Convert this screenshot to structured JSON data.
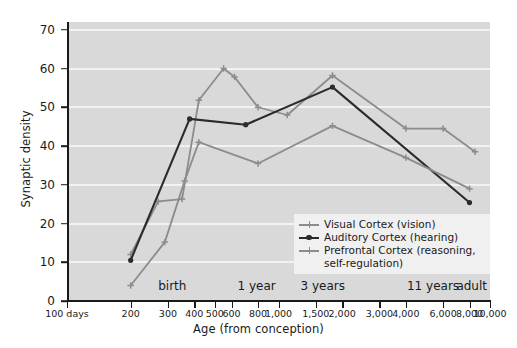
{
  "chart_data": {
    "type": "line",
    "title": "",
    "xlabel": "Age (from conception)",
    "ylabel": "Synaptic density",
    "xscale": "log",
    "x_tick_labels": [
      "100 days",
      "200",
      "300",
      "400",
      "500",
      "600",
      "800",
      "1,000",
      "1,500",
      "2,000",
      "3,000",
      "4,000",
      "6,000",
      "8,000",
      "10,000"
    ],
    "x_tick_values": [
      100,
      200,
      300,
      400,
      500,
      600,
      800,
      1000,
      1500,
      2000,
      3000,
      4000,
      6000,
      8000,
      10000
    ],
    "xlim": [
      100,
      10000
    ],
    "y_tick_labels": [
      "0",
      "10",
      "20",
      "30",
      "40",
      "50",
      "60",
      "70"
    ],
    "y_tick_values": [
      0,
      10,
      20,
      30,
      40,
      50,
      60,
      70
    ],
    "ylim": [
      0,
      72
    ],
    "grid": true,
    "legend_position": "lower right",
    "era_annotations": [
      {
        "label": "birth",
        "x": 270
      },
      {
        "label": "1 year",
        "x": 640
      },
      {
        "label": "3 years",
        "x": 1270
      },
      {
        "label": "11 years",
        "x": 4050
      },
      {
        "label": "adult",
        "x": 9800
      }
    ],
    "series": [
      {
        "name": "Visual Cortex (vision)",
        "color": "#8c8c8c",
        "marker": "plus",
        "x": [
          200,
          270,
          350,
          420,
          550,
          620,
          800,
          1100,
          1800,
          4000,
          6000,
          8500
        ],
        "values": [
          12.0,
          25.7,
          26.3,
          51.8,
          60.0,
          57.8,
          50.0,
          48.0,
          58.2,
          44.5,
          44.5,
          38.5
        ]
      },
      {
        "name": "Auditory Cortex (hearing)",
        "color": "#2b2b2b",
        "marker": "dot",
        "x": [
          200,
          380,
          700,
          1800,
          8000
        ],
        "values": [
          10.5,
          47.0,
          45.5,
          55.2,
          25.4
        ]
      },
      {
        "name": "Prefrontal Cortex (reasoning, self-regulation)",
        "color": "#8c8c8c",
        "marker": "plus",
        "x": [
          200,
          290,
          360,
          420,
          800,
          1800,
          4000,
          8000
        ],
        "values": [
          4.0,
          15.2,
          31.0,
          41.0,
          35.5,
          45.2,
          37.0,
          29.0
        ]
      }
    ]
  },
  "legend": {
    "entries": [
      {
        "label": "Visual Cortex (vision)"
      },
      {
        "label": "Auditory Cortex (hearing)"
      },
      {
        "label": "Prefrontal Cortex (reasoning,"
      }
    ],
    "continuation": "self-regulation)"
  },
  "colors": {
    "plot_background": "#d9d9d9",
    "gridline": "#f2f2f2",
    "axis": "#1a1a1a",
    "light_series": "#8c8c8c",
    "dark_series": "#2b2b2b",
    "legend_background": "#f0f0f0",
    "page_background": "#ffffff"
  }
}
